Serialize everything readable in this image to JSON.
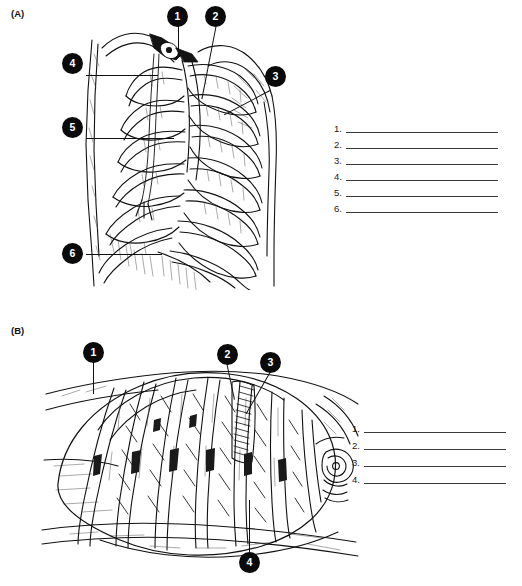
{
  "document": {
    "type": "anatomy-labeling-worksheet",
    "background_color": "#ffffff",
    "ink_color": "#000000",
    "marker_fill": "#0a0a0a",
    "marker_text_color": "#ffffff",
    "rule_color": "#3a3a3a"
  },
  "panels": [
    {
      "id": "A",
      "letter": "(A)",
      "figure_name": "thoracic-wall-anterior-view",
      "markers": [
        {
          "number": "1",
          "label": "1"
        },
        {
          "number": "2",
          "label": "2"
        },
        {
          "number": "3",
          "label": "3"
        },
        {
          "number": "4",
          "label": "4"
        },
        {
          "number": "5",
          "label": "5"
        },
        {
          "number": "6",
          "label": "6"
        }
      ],
      "answers": [
        {
          "number": "1.",
          "value": ""
        },
        {
          "number": "2.",
          "value": ""
        },
        {
          "number": "3.",
          "value": ""
        },
        {
          "number": "4.",
          "value": ""
        },
        {
          "number": "5.",
          "value": ""
        },
        {
          "number": "6.",
          "value": ""
        }
      ]
    },
    {
      "id": "B",
      "letter": "(B)",
      "figure_name": "intercostal-muscles-detail",
      "markers": [
        {
          "number": "1",
          "label": "1"
        },
        {
          "number": "2",
          "label": "2"
        },
        {
          "number": "3",
          "label": "3"
        },
        {
          "number": "4",
          "label": "4"
        }
      ],
      "answers": [
        {
          "number": "1.",
          "value": ""
        },
        {
          "number": "2.",
          "value": ""
        },
        {
          "number": "3.",
          "value": ""
        },
        {
          "number": "4.",
          "value": ""
        }
      ]
    }
  ]
}
